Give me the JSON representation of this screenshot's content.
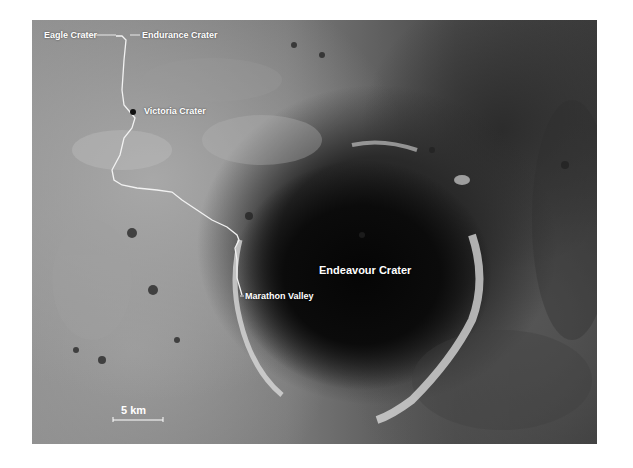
{
  "map": {
    "type": "satellite-grayscale",
    "subject": "Mars Opportunity rover traverse",
    "labels": {
      "eagle": "Eagle Crater",
      "endurance": "Endurance Crater",
      "victoria": "Victoria Crater",
      "endeavour": "Endeavour Crater",
      "marathon": "Marathon Valley"
    },
    "scale_bar": {
      "label": "5 km"
    },
    "colors": {
      "trail": "#f2f2f2",
      "label_text": "#ffffff",
      "crater_floor": "#0a0a0a",
      "plains": "#8e8e8e"
    }
  }
}
